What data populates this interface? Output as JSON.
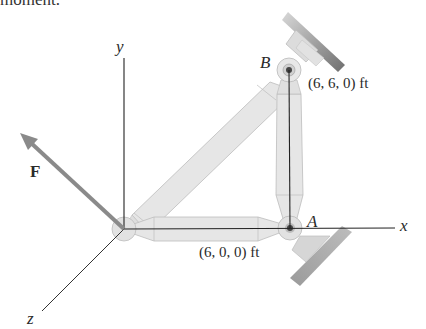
{
  "caption_fragment": "moment.",
  "axes": {
    "x_label": "x",
    "y_label": "y",
    "z_label": "z"
  },
  "points": {
    "A": {
      "label": "A",
      "coord_text": "(6, 0, 0) ft"
    },
    "B": {
      "label": "B",
      "coord_text": "(6, 6, 0) ft"
    }
  },
  "force": {
    "label": "F"
  },
  "colors": {
    "member_fill": "#e6e6e6",
    "member_edge": "#b5b5b5",
    "axis": "#222222",
    "force_arrow": "#8a8a8a",
    "wall": "#9a9a9a"
  }
}
